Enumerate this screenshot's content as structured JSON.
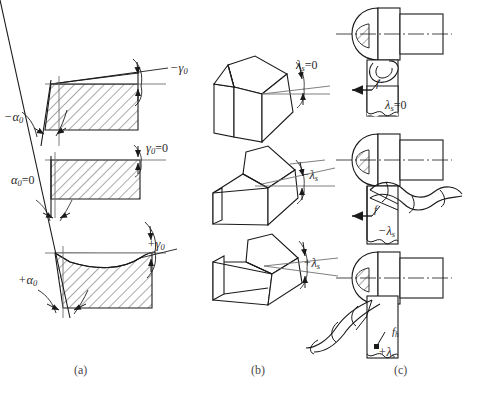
{
  "figure": {
    "background": "#ffffff",
    "line_color": "#1a1a1a",
    "hatch_color": "#555555"
  },
  "captions": {
    "a": "(a)",
    "b": "(b)",
    "c": "(c)"
  },
  "column_a": {
    "name": "rake-and-clearance-angle-views",
    "rows": [
      {
        "rake_label": "−γ",
        "rake_sub": "0",
        "clearance_label": "−α",
        "clearance_sub": "0",
        "clearance_suffix": ""
      },
      {
        "rake_label": "γ",
        "rake_sub": "0",
        "rake_suffix": "=0",
        "clearance_label": "α",
        "clearance_sub": "0",
        "clearance_suffix": "=0"
      },
      {
        "rake_label": "+γ",
        "rake_sub": "0",
        "clearance_label": "+α",
        "clearance_sub": "0",
        "clearance_suffix": ""
      }
    ]
  },
  "column_b": {
    "name": "inclination-angle-isometric-views",
    "rows": [
      {
        "label": "λ",
        "sub": "s",
        "suffix": "=0"
      },
      {
        "label": "−λ",
        "sub": "s",
        "suffix": ""
      },
      {
        "label": "+λ",
        "sub": "s",
        "suffix": ""
      }
    ]
  },
  "column_c": {
    "name": "chip-flow-direction-views",
    "rows": [
      {
        "angle_label": "λ",
        "angle_sub": "s",
        "angle_suffix": "=0",
        "feed_label": "f",
        "feed_sub": ""
      },
      {
        "angle_label": "−λ",
        "angle_sub": "s",
        "angle_suffix": "",
        "feed_label": "f",
        "feed_sub": ""
      },
      {
        "angle_label": "+λ",
        "angle_sub": "s",
        "angle_suffix": "",
        "feed_label": "f",
        "feed_sub": "h"
      }
    ]
  }
}
